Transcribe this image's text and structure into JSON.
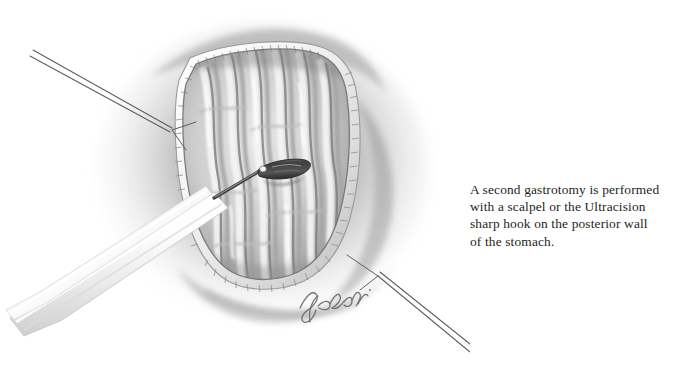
{
  "figure": {
    "kind": "medical-illustration",
    "medium": "graphite pencil drawing",
    "background_color": "#ffffff",
    "signature": "Kobashi",
    "ink_color": "#231f20",
    "palette": {
      "paper": "#ffffff",
      "tissue_light": "#f2f2f2",
      "tissue_mid": "#c9c9c9",
      "tissue_shadow": "#8f8f8f",
      "tissue_deep": "#6d6d6d",
      "staple_rim": "#fbfbfb",
      "instrument_dark": "#4a4a4a",
      "suture": "#5c5c5c"
    },
    "labels": {
      "opening": "gastrotomy-opening",
      "rugae": "gastric-rugae-folds",
      "staple_line": "staple-suture-rim",
      "hook": "ultracision-sharp-hook",
      "shaft": "instrument-shaft",
      "suture_upper_left": "retraction-suture-upper-left",
      "suture_lower_right": "retraction-suture-lower-right"
    }
  },
  "caption": {
    "lines": [
      "A second gastrotomy is performed",
      "with a scalpel or the Ultracision",
      "sharp hook on the posterior wall",
      "of the stomach."
    ],
    "full_text": "A second gastrotomy is performed with a scalpel or the Ultracision sharp hook on the posterior wall of the stomach."
  }
}
